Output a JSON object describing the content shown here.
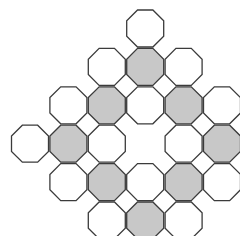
{
  "figure": {
    "canvas": {
      "width": 240,
      "height": 236,
      "background": "#ffffff"
    },
    "style": {
      "fill_shaded": "#c8c8c8",
      "fill_plain": "#ffffff",
      "stroke": "#3b3b3b",
      "stroke_width": 1.3
    },
    "geometry": {
      "cell_pitch_x": 38.4,
      "cell_pitch_y": 38.4,
      "octagon_width": 37.0,
      "origin_x": 11.5,
      "origin_y": 10.0,
      "columns": 7,
      "rows": 7
    },
    "legend": {
      "shaded_label": "shaded octagon",
      "plain_label": "plain octagon",
      "gap_label": "square gap"
    },
    "counts": {
      "total_octagons": 25,
      "shaded_octagons": 9,
      "plain_octagons": 16,
      "missing_center": 1
    },
    "row_counts": [
      1,
      3,
      5,
      6,
      5,
      3,
      1
    ],
    "cells": [
      {
        "row": 0,
        "col": 3,
        "shaded": false,
        "name": "octagon-r0-c3"
      },
      {
        "row": 1,
        "col": 2,
        "shaded": false,
        "name": "octagon-r1-c2"
      },
      {
        "row": 1,
        "col": 3,
        "shaded": true,
        "name": "octagon-r1-c3"
      },
      {
        "row": 1,
        "col": 4,
        "shaded": false,
        "name": "octagon-r1-c4"
      },
      {
        "row": 2,
        "col": 1,
        "shaded": false,
        "name": "octagon-r2-c1"
      },
      {
        "row": 2,
        "col": 2,
        "shaded": true,
        "name": "octagon-r2-c2"
      },
      {
        "row": 2,
        "col": 3,
        "shaded": false,
        "name": "octagon-r2-c3"
      },
      {
        "row": 2,
        "col": 4,
        "shaded": true,
        "name": "octagon-r2-c4"
      },
      {
        "row": 2,
        "col": 5,
        "shaded": false,
        "name": "octagon-r2-c5"
      },
      {
        "row": 3,
        "col": 0,
        "shaded": false,
        "name": "octagon-r3-c0"
      },
      {
        "row": 3,
        "col": 1,
        "shaded": true,
        "name": "octagon-r3-c1"
      },
      {
        "row": 3,
        "col": 2,
        "shaded": false,
        "name": "octagon-r3-c2"
      },
      {
        "row": 3,
        "col": 4,
        "shaded": false,
        "name": "octagon-r3-c4"
      },
      {
        "row": 3,
        "col": 5,
        "shaded": true,
        "name": "octagon-r3-c5"
      },
      {
        "row": 3,
        "col": 6,
        "shaded": false,
        "name": "octagon-r3-c6"
      },
      {
        "row": 4,
        "col": 1,
        "shaded": false,
        "name": "octagon-r4-c1"
      },
      {
        "row": 4,
        "col": 2,
        "shaded": true,
        "name": "octagon-r4-c2"
      },
      {
        "row": 4,
        "col": 3,
        "shaded": false,
        "name": "octagon-r4-c3"
      },
      {
        "row": 4,
        "col": 4,
        "shaded": true,
        "name": "octagon-r4-c4"
      },
      {
        "row": 4,
        "col": 5,
        "shaded": false,
        "name": "octagon-r4-c5"
      },
      {
        "row": 5,
        "col": 2,
        "shaded": false,
        "name": "octagon-r5-c2"
      },
      {
        "row": 5,
        "col": 3,
        "shaded": true,
        "name": "octagon-r5-c3"
      },
      {
        "row": 5,
        "col": 4,
        "shaded": false,
        "name": "octagon-r5-c4"
      },
      {
        "row": 6,
        "col": 3,
        "shaded": false,
        "name": "octagon-r6-c3"
      }
    ],
    "missing_cells": [
      {
        "row": 3,
        "col": 3,
        "name": "missing-center-cell"
      }
    ]
  }
}
